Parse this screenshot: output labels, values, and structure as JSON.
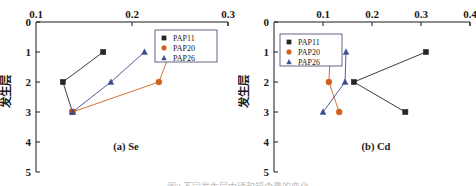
{
  "figure": {
    "background": "#ffffff",
    "ylabel_cjk": "发生层",
    "partial_bottom_text": "图3 不同发生层中硒和镉含量的变化"
  },
  "colors": {
    "pap11": "#262626",
    "pap20": "#D2601A",
    "pap26": "#3B4E8C",
    "axis": "#1a1a1a",
    "legend_border": "#3a3f6b"
  },
  "legend": {
    "entries": [
      {
        "label": "PAP11",
        "marker": "square",
        "color": "#262626"
      },
      {
        "label": "PAP20",
        "marker": "circle",
        "color": "#D2601A"
      },
      {
        "label": "PAP26",
        "marker": "triangle",
        "color": "#3B4E8C"
      }
    ]
  },
  "chart_data": [
    {
      "type": "line",
      "id": "panel-a",
      "title": "(a) Se",
      "xlabel": "",
      "ylabel": "发生层",
      "x_axis_position": "top",
      "y_axis_inverted": true,
      "xlim": [
        0.1,
        0.3
      ],
      "ylim": [
        0,
        5
      ],
      "xticks": [
        0.1,
        0.2,
        0.3
      ],
      "xtick_labels": [
        "0.1",
        "0.2",
        "0.3"
      ],
      "yticks": [
        0,
        1,
        2,
        3,
        4,
        5
      ],
      "ytick_labels": [
        "0",
        "1",
        "2",
        "3",
        "4",
        "5"
      ],
      "grid": false,
      "legend_position": "top-right",
      "series": [
        {
          "name": "PAP11",
          "marker": "square",
          "color": "#262626",
          "points": [
            {
              "x": 0.17,
              "y": 1
            },
            {
              "x": 0.128,
              "y": 2
            },
            {
              "x": 0.138,
              "y": 3
            }
          ]
        },
        {
          "name": "PAP20",
          "marker": "circle",
          "color": "#D2601A",
          "points": [
            {
              "x": 0.24,
              "y": 1
            },
            {
              "x": 0.228,
              "y": 2
            },
            {
              "x": 0.138,
              "y": 3
            }
          ]
        },
        {
          "name": "PAP26",
          "marker": "triangle",
          "color": "#3B4E8C",
          "points": [
            {
              "x": 0.213,
              "y": 1
            },
            {
              "x": 0.178,
              "y": 2
            },
            {
              "x": 0.138,
              "y": 3
            }
          ]
        }
      ]
    },
    {
      "type": "line",
      "id": "panel-b",
      "title": "(b) Cd",
      "xlabel": "",
      "ylabel": "发生层",
      "x_axis_position": "top",
      "y_axis_inverted": true,
      "xlim": [
        0.0,
        0.4
      ],
      "ylim": [
        0,
        5
      ],
      "xticks": [
        0.1,
        0.2,
        0.3,
        0.4
      ],
      "xtick_labels": [
        "0.1",
        "0.2",
        "0.3",
        "0.4"
      ],
      "yticks": [
        0,
        1,
        2,
        3,
        4,
        5
      ],
      "ytick_labels": [
        "0",
        "1",
        "2",
        "3",
        "4",
        "5"
      ],
      "grid": false,
      "legend_position": "top-left",
      "series": [
        {
          "name": "PAP11",
          "marker": "square",
          "color": "#262626",
          "points": [
            {
              "x": 0.31,
              "y": 1
            },
            {
              "x": 0.163,
              "y": 2
            },
            {
              "x": 0.268,
              "y": 3
            }
          ]
        },
        {
          "name": "PAP20",
          "marker": "circle",
          "color": "#D2601A",
          "points": [
            {
              "x": 0.115,
              "y": 1
            },
            {
              "x": 0.112,
              "y": 2
            },
            {
              "x": 0.133,
              "y": 3
            }
          ]
        },
        {
          "name": "PAP26",
          "marker": "triangle",
          "color": "#3B4E8C",
          "points": [
            {
              "x": 0.147,
              "y": 1
            },
            {
              "x": 0.145,
              "y": 2
            },
            {
              "x": 0.1,
              "y": 3
            }
          ]
        }
      ]
    }
  ]
}
